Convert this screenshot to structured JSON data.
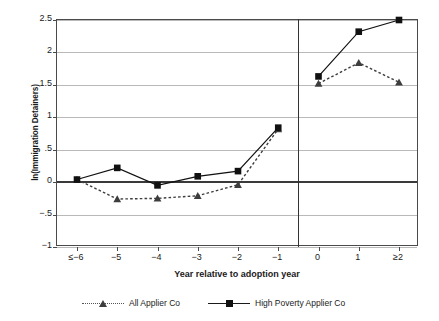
{
  "chart_data": {
    "type": "line",
    "title": "",
    "xlabel": "Year relative to adoption year",
    "ylabel": "ln(Immigration Detainers)",
    "categories": [
      "≤−6",
      "−5",
      "−4",
      "−3",
      "−2",
      "−1",
      "0",
      "1",
      "≥2"
    ],
    "x": [
      -6,
      -5,
      -4,
      -3,
      -2,
      -1,
      0,
      1,
      2
    ],
    "ylim": [
      -1,
      2.5
    ],
    "yticks": [
      2.5,
      2,
      1.5,
      1,
      0.5,
      0,
      -0.5,
      -1
    ],
    "ytick_labels": [
      "2.5",
      "2",
      "1.5",
      "1",
      ".5",
      "0",
      "−.5",
      "−1"
    ],
    "grid": true,
    "zero_reference_line": 0,
    "vertical_divider_between": [
      "−1",
      "0"
    ],
    "legend_position": "below",
    "series": [
      {
        "name": "All Applier Co",
        "marker": "triangle",
        "line_style": "dotted",
        "color": "#3d3d3d",
        "values": [
          0.04,
          -0.26,
          -0.25,
          -0.21,
          -0.04,
          0.82,
          1.52,
          1.84,
          1.54
        ]
      },
      {
        "name": "High Poverty Applier Co",
        "marker": "square",
        "line_style": "solid",
        "color": "#111111",
        "values": [
          0.04,
          0.22,
          -0.05,
          0.09,
          0.17,
          0.84,
          1.63,
          2.32,
          2.5
        ]
      }
    ]
  },
  "legend": {
    "items": [
      {
        "label": "All Applier Co",
        "marker": "triangle-marker-icon",
        "style": "dotted"
      },
      {
        "label": "High Poverty Applier Co",
        "marker": "square-marker-icon",
        "style": "solid"
      }
    ]
  }
}
